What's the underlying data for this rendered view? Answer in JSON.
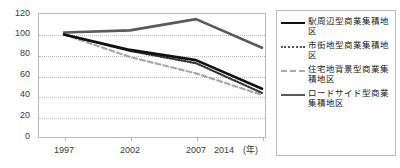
{
  "chart_data": {
    "type": "line",
    "title": "",
    "xlabel": "(年)",
    "ylabel": "",
    "categories": [
      "1997",
      "2002",
      "2007",
      "2014"
    ],
    "x": [
      1997,
      2002,
      2007,
      2014
    ],
    "ylim": [
      0,
      120
    ],
    "yticks": [
      0,
      20,
      40,
      60,
      80,
      100,
      120
    ],
    "grid": true,
    "legend_position": "right",
    "series": [
      {
        "name": "駅周辺型商業集積地区",
        "values": [
          100,
          85,
          75,
          47
        ],
        "style": "solid",
        "color": "#111111",
        "width": 2.6
      },
      {
        "name": "市街地型商業集積地区",
        "values": [
          100,
          84,
          72,
          43
        ],
        "style": "dotted",
        "color": "#333333",
        "width": 2.2
      },
      {
        "name": "住宅地背景型商業集積地区",
        "values": [
          100,
          78,
          62,
          41
        ],
        "style": "dashed",
        "color": "#a8a8a8",
        "width": 2.2
      },
      {
        "name": "ロードサイド型商業集積地区",
        "values": [
          102,
          104,
          115,
          87
        ],
        "style": "solid",
        "color": "#5a5a5a",
        "width": 2.6
      }
    ]
  },
  "legend": {
    "items": [
      {
        "label": "駅周辺型商業集積地区",
        "key": "solid-black-line-icon"
      },
      {
        "label": "市街地型商業集積地区",
        "key": "dotted-line-icon"
      },
      {
        "label": "住宅地背景型商業集積地区",
        "key": "dashed-line-icon"
      },
      {
        "label": "ロードサイド型商業集積地区",
        "key": "solid-gray-line-icon"
      }
    ]
  },
  "axes": {
    "y_ticks": [
      "120",
      "100",
      "80",
      "60",
      "40",
      "20",
      "0"
    ],
    "x_ticks": [
      "1997",
      "2002",
      "2007",
      "2014"
    ],
    "x_unit": "(年)"
  }
}
